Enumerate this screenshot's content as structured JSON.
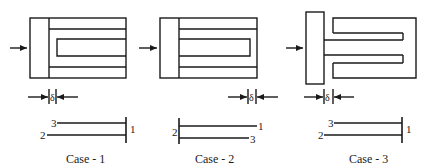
{
  "figure": {
    "colors": {
      "line": "#1a1a1a",
      "background": "#ffffff"
    },
    "cases": [
      {
        "caption": "Case - 1",
        "gap_symbol": "δ",
        "gap_position": "left, between plate and strips",
        "beam_labels": {
          "top": "3",
          "bottom": "2",
          "end": "1"
        }
      },
      {
        "caption": "Case - 2",
        "gap_symbol": "δ",
        "gap_position": "right, at far end of strips",
        "beam_labels": {
          "start": "2",
          "top": "1",
          "bottom": "3"
        }
      },
      {
        "caption": "Case - 3",
        "gap_symbol": "δ",
        "gap_position": "left, between plate and outer strips",
        "beam_labels": {
          "top": "3",
          "bottom": "2",
          "end": "1"
        }
      }
    ]
  }
}
